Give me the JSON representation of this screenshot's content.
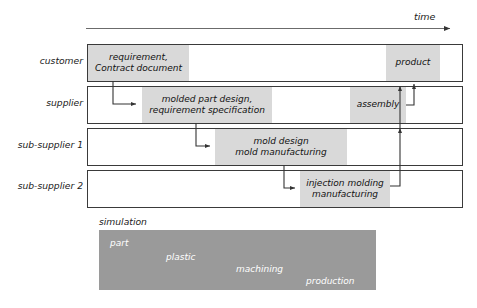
{
  "figure": {
    "type": "process-timeline-swimlane-diagram",
    "time_axis": {
      "label": "time",
      "direction": "left-to-right"
    },
    "colors": {
      "block_fill": "#d9d9d9",
      "lane_border": "#3a3a3a",
      "simulation_band": "#9a9a9a",
      "simulation_text": "#ffffff",
      "arrow": "#333333",
      "background": "#ffffff"
    }
  },
  "lanes": [
    {
      "label": "customer",
      "blocks": [
        {
          "text": "requirement,\nContract document"
        },
        {
          "text": "product"
        }
      ]
    },
    {
      "label": "supplier",
      "blocks": [
        {
          "text": "molded part design,\nrequirement specification"
        },
        {
          "text": "assembly"
        }
      ]
    },
    {
      "label": "sub-supplier 1",
      "blocks": [
        {
          "text": "mold design\nmold manufacturing"
        }
      ]
    },
    {
      "label": "sub-supplier 2",
      "blocks": [
        {
          "text": "injection molding\nmanufacturing"
        }
      ]
    }
  ],
  "simulation": {
    "caption": "simulation",
    "words": [
      "part",
      "plastic",
      "machining",
      "production"
    ]
  },
  "caption": ""
}
